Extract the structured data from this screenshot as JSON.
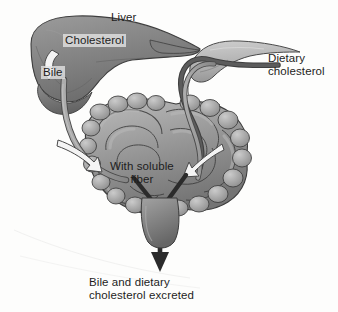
{
  "diagram": {
    "background_color": "#fdfdfc",
    "palette": {
      "organ_mid_gray": "#8a8a8a",
      "organ_dark_gray": "#6f6f6f",
      "organ_light_gray": "#b5b5b5",
      "outline": "#3a3a3a",
      "dark_tube": "#4a4a4a",
      "light_tube": "#9d9d9d",
      "white_arrow_fill": "#f2f2f2",
      "text_color": "#1d1d1d",
      "label_box": "#e2e2e2"
    },
    "labels": {
      "liver": "Liver",
      "cholesterol": "Cholesterol",
      "bile": "Bile",
      "dietary_cholesterol_line1": "Dietary",
      "dietary_cholesterol_line2": "cholesterol",
      "soluble_fiber_line1": "With soluble",
      "soluble_fiber_line2": "fiber",
      "excreted_line1": "Bile and dietary",
      "excreted_line2": "cholesterol excreted"
    },
    "structures": [
      {
        "name": "liver",
        "label": "Liver"
      },
      {
        "name": "small-intestine",
        "label": "Small intestine coils"
      },
      {
        "name": "stomach",
        "label": "Stomach"
      },
      {
        "name": "bile-duct",
        "label": "Bile duct"
      },
      {
        "name": "dietary-cholesterol-tube",
        "label": "Dietary cholesterol tube"
      },
      {
        "name": "excretion-arrow",
        "label": "Excretion arrow"
      }
    ],
    "arrows": [
      {
        "name": "cholesterol-to-bile-arrow",
        "style": "white-hollow-curved",
        "from": "Cholesterol",
        "to": "Bile"
      },
      {
        "name": "fiber-arrow-left",
        "style": "white-hollow-curved",
        "points_to": "intestine-center"
      },
      {
        "name": "fiber-arrow-right",
        "style": "white-hollow-curved",
        "points_to": "intestine-center"
      },
      {
        "name": "excretion-arrow-down",
        "style": "dark-solid-y",
        "points_to": "excreted"
      }
    ]
  }
}
